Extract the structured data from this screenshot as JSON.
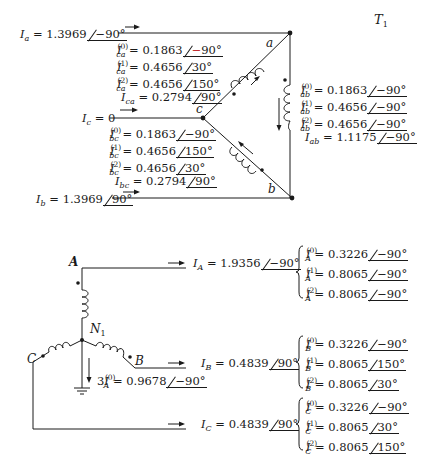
{
  "figure": {
    "title_label": "T",
    "title_sub": "1"
  },
  "delta_side": {
    "nodes": {
      "a": "a",
      "b": "b",
      "c": "c"
    },
    "line_currents": {
      "Ia": {
        "sym": "I",
        "sub": "a",
        "mag": "1.3969",
        "ang": "−90°"
      },
      "Ic": {
        "sym": "I",
        "sub": "c",
        "value": "0"
      },
      "Ib": {
        "sym": "I",
        "sub": "b",
        "mag": "1.3969",
        "ang": "90°"
      }
    },
    "ca_branch": [
      {
        "sym": "I",
        "sub": "ca",
        "sup": "(0)",
        "mag": "0.1863",
        "ang_sign": "−",
        "ang_val": "90°",
        "sign_color": "#c0282d"
      },
      {
        "sym": "I",
        "sub": "ca",
        "sup": "(1)",
        "mag": "0.4656",
        "ang": "30°"
      },
      {
        "sym": "I",
        "sub": "ca",
        "sup": "(2)",
        "mag": "0.4656",
        "ang": "150°"
      },
      {
        "sym": "I",
        "sub": "ca",
        "sup": "",
        "mag": "0.2794",
        "ang": "90°"
      }
    ],
    "bc_branch": [
      {
        "sym": "I",
        "sub": "bc",
        "sup": "(0)",
        "mag": "0.1863",
        "ang": "−90°"
      },
      {
        "sym": "I",
        "sub": "bc",
        "sup": "(1)",
        "mag": "0.4656",
        "ang": "150°"
      },
      {
        "sym": "I",
        "sub": "bc",
        "sup": "(2)",
        "mag": "0.4656",
        "ang": "30°"
      },
      {
        "sym": "I",
        "sub": "bc",
        "sup": "",
        "mag": "0.2794",
        "ang": "90°"
      }
    ],
    "ab_branch": [
      {
        "sym": "I",
        "sub": "ab",
        "sup": "(0)",
        "mag": "0.1863",
        "ang": "−90°"
      },
      {
        "sym": "I",
        "sub": "ab",
        "sup": "(1)",
        "mag": "0.4656",
        "ang": "−90°"
      },
      {
        "sym": "I",
        "sub": "ab",
        "sup": "(2)",
        "mag": "0.4656",
        "ang": "−90°"
      },
      {
        "sym": "I",
        "sub": "ab",
        "sup": "",
        "mag": "1.1175",
        "ang": "−90°"
      }
    ]
  },
  "wye_side": {
    "nodes": {
      "A": "A",
      "B": "B",
      "C": "C",
      "N": "N",
      "N_sub": "1"
    },
    "ground_current": {
      "prefix": "3",
      "sym": "I",
      "sub": "A",
      "sup": "(0)",
      "mag": "0.9678",
      "ang": "−90°"
    },
    "phases": [
      {
        "line": {
          "sym": "I",
          "sub": "A",
          "mag": "1.9356",
          "ang": "−90°"
        },
        "components": [
          {
            "sym": "I",
            "sub": "A",
            "sup": "(0)",
            "mag": "0.3226",
            "ang": "−90°"
          },
          {
            "sym": "I",
            "sub": "A",
            "sup": "(1)",
            "mag": "0.8065",
            "ang": "−90°"
          },
          {
            "sym": "I",
            "sub": "A",
            "sup": "(2)",
            "mag": "0.8065",
            "ang": "−90°"
          }
        ]
      },
      {
        "line": {
          "sym": "I",
          "sub": "B",
          "mag": "0.4839",
          "ang": "90°"
        },
        "components": [
          {
            "sym": "I",
            "sub": "B",
            "sup": "(0)",
            "mag": "0.3226",
            "ang": "−90°"
          },
          {
            "sym": "I",
            "sub": "B",
            "sup": "(1)",
            "mag": "0.8065",
            "ang": "150°"
          },
          {
            "sym": "I",
            "sub": "B",
            "sup": "(2)",
            "mag": "0.8065",
            "ang": "30°"
          }
        ]
      },
      {
        "line": {
          "sym": "I",
          "sub": "C",
          "mag": "0.4839",
          "ang": "90°"
        },
        "components": [
          {
            "sym": "I",
            "sub": "C",
            "sup": "(0)",
            "mag": "0.3226",
            "ang": "−90°"
          },
          {
            "sym": "I",
            "sub": "C",
            "sup": "(1)",
            "mag": "0.8065",
            "ang": "30°"
          },
          {
            "sym": "I",
            "sub": "C",
            "sup": "(2)",
            "mag": "0.8065",
            "ang": "150°"
          }
        ]
      }
    ]
  },
  "symbols": {
    "equals": "="
  },
  "colors": {
    "ink": "#1a1a1a",
    "highlight_minus": "#c0282d"
  }
}
